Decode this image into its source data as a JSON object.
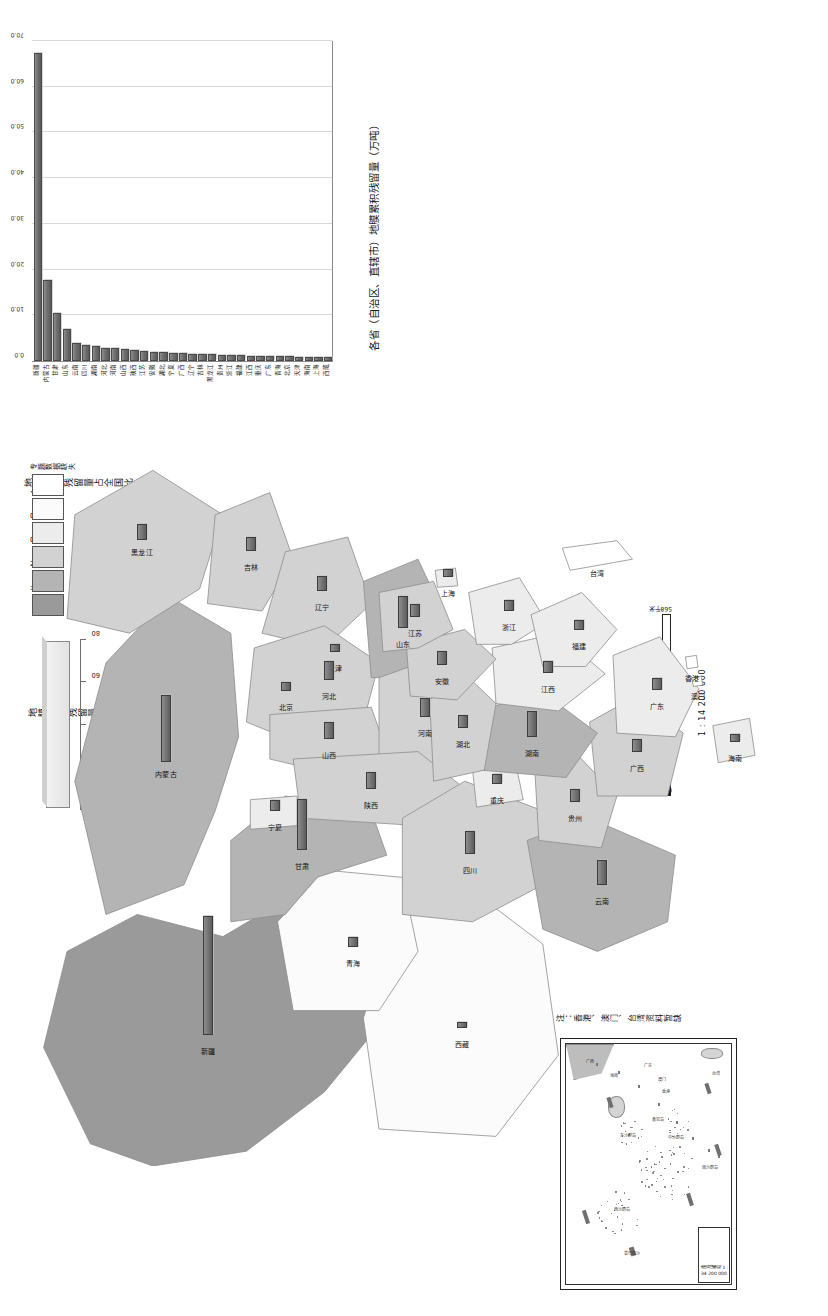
{
  "document": {
    "kind": "thematic-map",
    "orientation": "rotated-90",
    "note": "注：香港、澳门、台湾资料暂缺"
  },
  "chart": {
    "title": "各省（自治区、直辖市）地膜累积残留量（万吨）",
    "axis_ticks": [
      "0.0",
      "10.0",
      "20.0",
      "30.0",
      "40.0",
      "50.0",
      "60.0",
      "70.0"
    ],
    "xmax": 70
  },
  "chart_data": {
    "type": "bar",
    "title": "各省（自治区、直辖市）地膜累积残留量（万吨）",
    "xlabel": "地膜累积残留量（万吨）",
    "ylabel": "",
    "xlim": [
      0,
      70
    ],
    "grid": true,
    "orientation": "horizontal",
    "categories": [
      "新疆",
      "内蒙古",
      "甘肃",
      "山东",
      "云南",
      "四川",
      "湖南",
      "河北",
      "河南",
      "山西",
      "陕西",
      "江苏",
      "安徽",
      "湖北",
      "宁夏",
      "广西",
      "辽宁",
      "吉林",
      "黑龙江",
      "贵州",
      "浙江",
      "福建",
      "江西",
      "重庆",
      "广东",
      "青海",
      "北京",
      "天津",
      "海南",
      "上海",
      "西藏"
    ],
    "values": [
      67.0,
      17.2,
      10.1,
      6.6,
      3.4,
      3.0,
      2.8,
      2.5,
      2.3,
      2.1,
      1.9,
      1.7,
      1.6,
      1.5,
      1.4,
      1.3,
      1.2,
      1.1,
      1.0,
      0.9,
      0.85,
      0.8,
      0.75,
      0.7,
      0.65,
      0.6,
      0.55,
      0.5,
      0.45,
      0.4,
      0.35
    ]
  },
  "class_legend": {
    "title": "地膜累积残留量占全国比（%）",
    "classes": [
      {
        "label": ">10",
        "color": "#9a9a9a"
      },
      {
        "label": "2 - 10",
        "color": "#b4b4b4"
      },
      {
        "label": "0.7 - 2",
        "color": "#d2d2d2"
      },
      {
        "label": "0.3 - 0.7",
        "color": "#ececec"
      },
      {
        "label": "< 0.3",
        "color": "#fbfbfb"
      },
      {
        "label": "专题数据缺失",
        "color": "#ffffff"
      }
    ]
  },
  "bar_legend": {
    "title": "地膜累积残留量（万吨）",
    "ticks": [
      "0",
      "20",
      "40",
      "60",
      "80"
    ]
  },
  "scalebar": {
    "labels": [
      "0",
      "142",
      "284",
      "426",
      "568千米"
    ],
    "ratio": "1 : 14 200 000"
  },
  "inset": {
    "scale_text": "南海诸岛",
    "scale_ratio": "1 : 34 200 000",
    "labels": [
      "东沙群岛",
      "西沙群岛",
      "中沙群岛",
      "南沙群岛",
      "黄岩岛",
      "海南",
      "广东",
      "广西",
      "台湾",
      "曾母暗沙",
      "澳门",
      "香港"
    ]
  },
  "provinces": [
    {
      "name": "新疆",
      "class": 0
    },
    {
      "name": "西藏",
      "class": 4
    },
    {
      "name": "青海",
      "class": 4
    },
    {
      "name": "甘肃",
      "class": 1
    },
    {
      "name": "内蒙古",
      "class": 1
    },
    {
      "name": "黑龙江",
      "class": 2
    },
    {
      "name": "吉林",
      "class": 2
    },
    {
      "name": "辽宁",
      "class": 2
    },
    {
      "name": "北京",
      "class": 3
    },
    {
      "name": "天津",
      "class": 3
    },
    {
      "name": "河北",
      "class": 2
    },
    {
      "name": "山西",
      "class": 2
    },
    {
      "name": "山东",
      "class": 1
    },
    {
      "name": "河南",
      "class": 2
    },
    {
      "name": "陕西",
      "class": 2
    },
    {
      "name": "宁夏",
      "class": 3
    },
    {
      "name": "四川",
      "class": 2
    },
    {
      "name": "重庆",
      "class": 3
    },
    {
      "name": "云南",
      "class": 1
    },
    {
      "name": "贵州",
      "class": 2
    },
    {
      "name": "广西",
      "class": 2
    },
    {
      "name": "广东",
      "class": 3
    },
    {
      "name": "湖南",
      "class": 1
    },
    {
      "name": "湖北",
      "class": 2
    },
    {
      "name": "江西",
      "class": 3
    },
    {
      "name": "安徽",
      "class": 2
    },
    {
      "name": "江苏",
      "class": 2
    },
    {
      "name": "浙江",
      "class": 3
    },
    {
      "name": "福建",
      "class": 3
    },
    {
      "name": "台湾",
      "class": 5
    },
    {
      "name": "海南",
      "class": 3
    },
    {
      "name": "上海",
      "class": 3
    },
    {
      "name": "香港",
      "class": 5
    },
    {
      "name": "澳门",
      "class": 5
    }
  ]
}
